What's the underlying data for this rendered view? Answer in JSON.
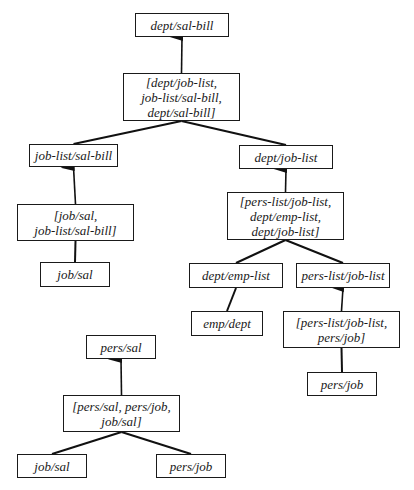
{
  "diagram": {
    "nodes": [
      {
        "id": "n1",
        "label": "dept/sal-bill",
        "x": 135,
        "y": 13,
        "w": 94,
        "h": 24
      },
      {
        "id": "n2",
        "label": "[dept/job-list,\njob-list/sal-bill,\ndept/sal-bill]",
        "x": 123,
        "y": 73,
        "w": 117,
        "h": 48
      },
      {
        "id": "n3",
        "label": "job-list/sal-bill",
        "x": 29,
        "y": 144,
        "w": 89,
        "h": 23
      },
      {
        "id": "n4",
        "label": "dept/job-list",
        "x": 239,
        "y": 145,
        "w": 94,
        "h": 24
      },
      {
        "id": "n5",
        "label": "[job/sal,\njob-list/sal-bill]",
        "x": 17,
        "y": 204,
        "w": 117,
        "h": 37
      },
      {
        "id": "n6",
        "label": "[pers-list/job-list,\ndept/emp-list,\ndept/job-list]",
        "x": 227,
        "y": 192,
        "w": 117,
        "h": 48
      },
      {
        "id": "n7",
        "label": "job/sal",
        "x": 40,
        "y": 262,
        "w": 70,
        "h": 25
      },
      {
        "id": "n8",
        "label": "dept/emp-list",
        "x": 189,
        "y": 263,
        "w": 94,
        "h": 25
      },
      {
        "id": "n9",
        "label": "pers-list/job-list",
        "x": 296,
        "y": 263,
        "w": 94,
        "h": 25
      },
      {
        "id": "n10",
        "label": "emp/dept",
        "x": 191,
        "y": 311,
        "w": 72,
        "h": 25
      },
      {
        "id": "n11",
        "label": "[pers-list/job-list,\npers/job]",
        "x": 283,
        "y": 311,
        "w": 117,
        "h": 37
      },
      {
        "id": "n12",
        "label": "pers/job",
        "x": 307,
        "y": 372,
        "w": 70,
        "h": 24
      },
      {
        "id": "n13",
        "label": "pers/sal",
        "x": 86,
        "y": 335,
        "w": 70,
        "h": 24
      },
      {
        "id": "n14",
        "label": "[pers/sal, pers/job,\njob/sal]",
        "x": 63,
        "y": 395,
        "w": 117,
        "h": 37
      },
      {
        "id": "n15",
        "label": "job/sal",
        "x": 17,
        "y": 454,
        "w": 70,
        "h": 24
      },
      {
        "id": "n16",
        "label": "pers/job",
        "x": 156,
        "y": 454,
        "w": 70,
        "h": 24
      }
    ],
    "edges": [
      {
        "from": "n2",
        "to": "n1",
        "arrow": true
      },
      {
        "from": "n2",
        "to": "n3",
        "arrow": false
      },
      {
        "from": "n2",
        "to": "n4",
        "arrow": false
      },
      {
        "from": "n5",
        "to": "n3",
        "arrow": true
      },
      {
        "from": "n7",
        "to": "n5",
        "arrow": false
      },
      {
        "from": "n6",
        "to": "n4",
        "arrow": true
      },
      {
        "from": "n6",
        "to": "n8",
        "arrow": false
      },
      {
        "from": "n6",
        "to": "n9",
        "arrow": false
      },
      {
        "from": "n8",
        "to": "n10",
        "arrow": false
      },
      {
        "from": "n11",
        "to": "n9",
        "arrow": true
      },
      {
        "from": "n12",
        "to": "n11",
        "arrow": false
      },
      {
        "from": "n14",
        "to": "n13",
        "arrow": true
      },
      {
        "from": "n14",
        "to": "n15",
        "arrow": false
      },
      {
        "from": "n14",
        "to": "n16",
        "arrow": false
      }
    ]
  }
}
